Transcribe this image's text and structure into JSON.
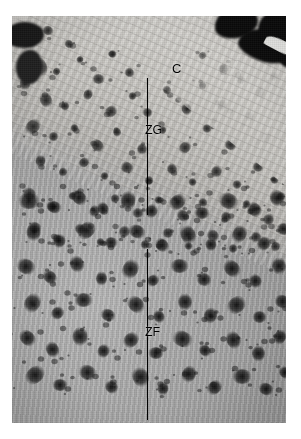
{
  "figure": {
    "type": "histology-micrograph",
    "caption_labels": [
      "C",
      "ZG",
      "ZF"
    ],
    "background_color": "#ffffff",
    "plate": {
      "left": 12,
      "top": 16,
      "width": 274,
      "height": 407,
      "tissue_tone": "#b2b0ac",
      "capsule_tone": "#d2d0cb",
      "blob_color": "#0a0a0a"
    }
  },
  "annotations": {
    "capsule": {
      "label": "C",
      "name": "capsule",
      "x": 160,
      "y": 46,
      "description": "capsule"
    },
    "zona_glomerulosa": {
      "label": "ZG",
      "name": "zona-glomerulosa",
      "x": 133,
      "y": 108,
      "line": {
        "x": 135,
        "y_top": 62,
        "y_bottom": 199
      },
      "description": "zona glomerulosa"
    },
    "zona_fasciculata": {
      "label": "ZF",
      "name": "zona-fasciculata",
      "x": 133,
      "y": 310,
      "line": {
        "x": 135,
        "y_top": 233,
        "y_bottom": 404
      },
      "description": "zona fasciculata"
    }
  },
  "speckle_zg": {
    "note": "dark argyrophil granule clusters, zona glomerulosa",
    "blobs": [
      [
        8,
        18,
        17,
        12
      ],
      [
        30,
        10,
        12,
        9
      ],
      [
        52,
        24,
        10,
        8
      ],
      [
        18,
        44,
        20,
        14
      ],
      [
        6,
        62,
        14,
        11
      ],
      [
        40,
        52,
        9,
        7
      ],
      [
        64,
        40,
        8,
        7
      ],
      [
        80,
        58,
        13,
        10
      ],
      [
        96,
        34,
        9,
        8
      ],
      [
        112,
        52,
        11,
        9
      ],
      [
        26,
        78,
        16,
        12
      ],
      [
        48,
        86,
        10,
        8
      ],
      [
        70,
        74,
        12,
        9
      ],
      [
        92,
        90,
        14,
        11
      ],
      [
        116,
        76,
        9,
        8
      ],
      [
        130,
        92,
        11,
        9
      ],
      [
        150,
        70,
        10,
        8
      ],
      [
        168,
        88,
        13,
        10
      ],
      [
        186,
        66,
        9,
        7
      ],
      [
        204,
        84,
        12,
        10
      ],
      [
        12,
        104,
        18,
        13
      ],
      [
        36,
        116,
        11,
        9
      ],
      [
        58,
        108,
        9,
        8
      ],
      [
        78,
        124,
        15,
        11
      ],
      [
        100,
        112,
        10,
        8
      ],
      [
        124,
        128,
        12,
        10
      ],
      [
        146,
        110,
        9,
        8
      ],
      [
        166,
        126,
        14,
        11
      ],
      [
        190,
        108,
        10,
        9
      ],
      [
        212,
        124,
        13,
        10
      ],
      [
        232,
        96,
        11,
        9
      ],
      [
        248,
        116,
        14,
        12
      ],
      [
        22,
        140,
        13,
        10
      ],
      [
        46,
        152,
        10,
        8
      ],
      [
        66,
        142,
        12,
        9
      ],
      [
        88,
        156,
        9,
        8
      ],
      [
        108,
        146,
        14,
        11
      ],
      [
        132,
        160,
        10,
        9
      ],
      [
        154,
        148,
        12,
        10
      ],
      [
        176,
        162,
        9,
        8
      ],
      [
        198,
        150,
        13,
        11
      ],
      [
        220,
        164,
        10,
        9
      ],
      [
        240,
        146,
        12,
        10
      ],
      [
        258,
        160,
        9,
        8
      ],
      [
        10,
        172,
        15,
        12
      ],
      [
        34,
        186,
        11,
        9
      ],
      [
        56,
        176,
        9,
        8
      ],
      [
        76,
        190,
        13,
        10
      ],
      [
        98,
        178,
        10,
        9
      ],
      [
        120,
        192,
        12,
        10
      ],
      [
        142,
        180,
        9,
        8
      ],
      [
        164,
        194,
        14,
        11
      ],
      [
        186,
        182,
        10,
        9
      ],
      [
        208,
        196,
        12,
        10
      ],
      [
        230,
        184,
        9,
        8
      ],
      [
        250,
        198,
        13,
        11
      ],
      [
        264,
        176,
        10,
        9
      ],
      [
        16,
        206,
        14,
        11
      ],
      [
        40,
        218,
        10,
        9
      ],
      [
        62,
        208,
        12,
        10
      ],
      [
        84,
        222,
        9,
        8
      ],
      [
        106,
        210,
        13,
        11
      ],
      [
        128,
        224,
        10,
        9
      ],
      [
        150,
        212,
        12,
        10
      ],
      [
        172,
        226,
        9,
        8
      ],
      [
        194,
        214,
        14,
        11
      ],
      [
        216,
        228,
        10,
        9
      ],
      [
        238,
        216,
        12,
        10
      ],
      [
        258,
        226,
        11,
        9
      ],
      [
        186,
        36,
        9,
        7
      ],
      [
        206,
        48,
        11,
        9
      ],
      [
        224,
        60,
        10,
        8
      ],
      [
        242,
        72,
        12,
        10
      ],
      [
        258,
        56,
        9,
        8
      ]
    ]
  },
  "speckle_zf": {
    "note": "coarse dark lipid/granule clusters, zona fasciculata",
    "blobs": [
      [
        6,
        6,
        22,
        16
      ],
      [
        34,
        14,
        16,
        12
      ],
      [
        58,
        4,
        18,
        13
      ],
      [
        84,
        16,
        14,
        11
      ],
      [
        106,
        6,
        20,
        15
      ],
      [
        132,
        18,
        15,
        12
      ],
      [
        156,
        8,
        19,
        14
      ],
      [
        182,
        20,
        16,
        12
      ],
      [
        206,
        6,
        21,
        16
      ],
      [
        234,
        16,
        17,
        13
      ],
      [
        256,
        4,
        18,
        14
      ],
      [
        12,
        38,
        19,
        14
      ],
      [
        40,
        48,
        15,
        12
      ],
      [
        64,
        36,
        21,
        15
      ],
      [
        92,
        50,
        14,
        11
      ],
      [
        116,
        38,
        18,
        13
      ],
      [
        142,
        52,
        16,
        12
      ],
      [
        166,
        40,
        20,
        15
      ],
      [
        192,
        52,
        14,
        11
      ],
      [
        218,
        40,
        19,
        14
      ],
      [
        244,
        50,
        16,
        13
      ],
      [
        264,
        36,
        15,
        12
      ],
      [
        4,
        72,
        20,
        15
      ],
      [
        30,
        84,
        16,
        12
      ],
      [
        56,
        70,
        18,
        14
      ],
      [
        82,
        86,
        15,
        11
      ],
      [
        108,
        74,
        21,
        16
      ],
      [
        134,
        88,
        14,
        11
      ],
      [
        158,
        72,
        19,
        14
      ],
      [
        184,
        86,
        16,
        13
      ],
      [
        210,
        74,
        20,
        15
      ],
      [
        236,
        88,
        15,
        12
      ],
      [
        258,
        72,
        18,
        14
      ],
      [
        10,
        108,
        21,
        16
      ],
      [
        38,
        120,
        15,
        12
      ],
      [
        62,
        106,
        19,
        14
      ],
      [
        88,
        122,
        16,
        12
      ],
      [
        114,
        110,
        20,
        15
      ],
      [
        140,
        124,
        14,
        11
      ],
      [
        164,
        108,
        18,
        14
      ],
      [
        190,
        122,
        17,
        13
      ],
      [
        214,
        110,
        21,
        16
      ],
      [
        240,
        124,
        15,
        12
      ],
      [
        262,
        108,
        17,
        13
      ],
      [
        6,
        144,
        19,
        14
      ],
      [
        32,
        156,
        17,
        13
      ],
      [
        58,
        142,
        20,
        15
      ],
      [
        84,
        158,
        15,
        12
      ],
      [
        110,
        146,
        18,
        14
      ],
      [
        136,
        160,
        16,
        12
      ],
      [
        160,
        144,
        21,
        16
      ],
      [
        186,
        158,
        14,
        11
      ],
      [
        212,
        146,
        19,
        14
      ],
      [
        238,
        160,
        17,
        13
      ],
      [
        260,
        144,
        16,
        12
      ],
      [
        12,
        180,
        22,
        16
      ],
      [
        40,
        192,
        16,
        12
      ],
      [
        66,
        178,
        19,
        15
      ],
      [
        92,
        194,
        15,
        12
      ],
      [
        118,
        182,
        21,
        16
      ],
      [
        144,
        196,
        14,
        11
      ],
      [
        168,
        180,
        18,
        14
      ],
      [
        194,
        194,
        17,
        13
      ],
      [
        220,
        182,
        20,
        15
      ],
      [
        246,
        196,
        16,
        12
      ],
      [
        266,
        180,
        14,
        11
      ]
    ]
  }
}
